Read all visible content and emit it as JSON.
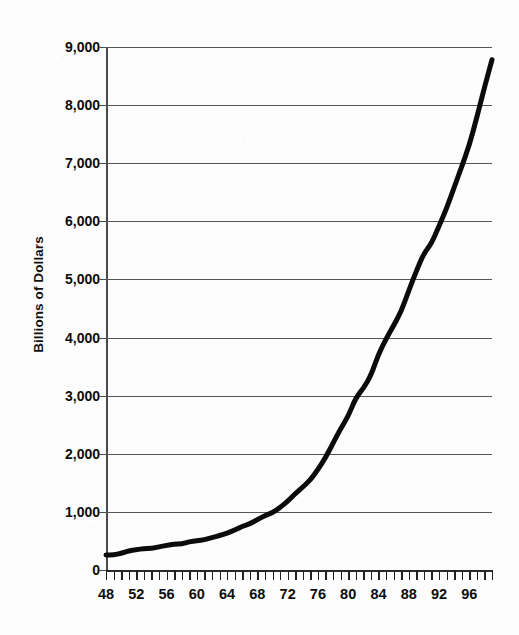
{
  "chart_data": {
    "type": "line",
    "title": "",
    "subtitle": "",
    "xlabel": "",
    "ylabel": "Billions of Dollars",
    "xlim": [
      48,
      99
    ],
    "ylim": [
      0,
      9000
    ],
    "grid": true,
    "legend": null,
    "legend_position": "none",
    "y_ticks": [
      0,
      1000,
      2000,
      3000,
      4000,
      5000,
      6000,
      7000,
      8000,
      9000
    ],
    "y_tick_labels": [
      "0",
      "1,000",
      "2,000",
      "3,000",
      "4,000",
      "5,000",
      "6,000",
      "7,000",
      "8,000",
      "9,000"
    ],
    "x_ticks": [
      48,
      49,
      50,
      51,
      52,
      53,
      54,
      55,
      56,
      57,
      58,
      59,
      60,
      61,
      62,
      63,
      64,
      65,
      66,
      67,
      68,
      69,
      70,
      71,
      72,
      73,
      74,
      75,
      76,
      77,
      78,
      79,
      80,
      81,
      82,
      83,
      84,
      85,
      86,
      87,
      88,
      89,
      90,
      91,
      92,
      93,
      94,
      95,
      96,
      97,
      98,
      99
    ],
    "x_tick_labels": [
      "48",
      "52",
      "56",
      "60",
      "64",
      "68",
      "72",
      "76",
      "80",
      "84",
      "88",
      "92",
      "96"
    ],
    "x_labeled_ticks": [
      48,
      52,
      56,
      60,
      64,
      68,
      72,
      76,
      80,
      84,
      88,
      92,
      96
    ],
    "x": [
      48,
      49,
      50,
      51,
      52,
      53,
      54,
      55,
      56,
      57,
      58,
      59,
      60,
      61,
      62,
      63,
      64,
      65,
      66,
      67,
      68,
      69,
      70,
      71,
      72,
      73,
      74,
      75,
      76,
      77,
      78,
      79,
      80,
      81,
      82,
      83,
      84,
      85,
      86,
      87,
      88,
      89,
      90,
      91,
      92,
      93,
      94,
      95,
      96,
      97,
      98,
      99
    ],
    "values": [
      258,
      259,
      287,
      329,
      349,
      370,
      369,
      400,
      422,
      445,
      449,
      488,
      504,
      521,
      560,
      591,
      633,
      686,
      752,
      794,
      867,
      937,
      987,
      1074,
      1182,
      1314,
      1427,
      1550,
      1730,
      1932,
      2180,
      2433,
      2646,
      2961,
      3125,
      3346,
      3716,
      3974,
      4206,
      4450,
      4805,
      5145,
      5449,
      5619,
      5921,
      6222,
      6586,
      6940,
      7311,
      7790,
      8305,
      8780
    ],
    "line_color": "#0b0b0b",
    "line_width": 5,
    "grid_color": "#555555",
    "axis_color": "#2a2a2a",
    "background": "#fdfdfd"
  },
  "axes": {
    "y_title": "Billions of Dollars"
  }
}
